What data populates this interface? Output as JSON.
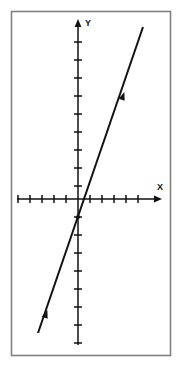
{
  "figure": {
    "title": "",
    "frame": {
      "color": "#808080",
      "x": 11,
      "y": 11,
      "width": 159,
      "height": 344
    },
    "background_color": "#ffffff",
    "ink_color": "#111111"
  },
  "axes": {
    "x_axis": {
      "label": "X",
      "label_x": 160,
      "label_y": 190,
      "y_pixel": 199,
      "start_x": 17,
      "end_x": 162,
      "tick_spacing_px": 12,
      "tick_half_length": 4,
      "ticks_left_px": [
        18,
        30,
        42,
        54,
        66
      ],
      "ticks_right_px": [
        90,
        102,
        114,
        126,
        138
      ],
      "arrow_at": "right"
    },
    "y_axis": {
      "label": "Y",
      "label_x": 84,
      "label_y": 25,
      "x_pixel": 78,
      "start_y": 19,
      "end_y": 345,
      "tick_spacing_px": 18,
      "tick_half_length": 4,
      "ticks_above_px": [
        42,
        60,
        78,
        96,
        114,
        132,
        150,
        168,
        186
      ],
      "ticks_below_px": [
        217,
        235,
        253,
        271,
        289,
        307,
        325,
        343
      ],
      "arrow_at": "top"
    },
    "origin": {
      "x": 78,
      "y": 199
    }
  },
  "chart_data": {
    "type": "line",
    "title": "",
    "xlabel": "X",
    "ylabel": "Y",
    "grid": false,
    "legend": null,
    "axis_style": "cartesian-arrows-with-unlabeled-ticks",
    "x_unit_px": 12,
    "y_unit_px": 18,
    "xlim": [
      -5.1,
      7.0
    ],
    "ylim": [
      -8.1,
      10.0
    ],
    "series": [
      {
        "name": "line",
        "style": "solid",
        "color": "#111111",
        "width_px": 2,
        "endpoints_px": [
          {
            "x": 38,
            "y": 333
          },
          {
            "x": 143,
            "y": 27
          }
        ],
        "endpoints_units": [
          {
            "x": -3.33,
            "y": -7.44
          },
          {
            "x": 5.42,
            "y": 9.56
          }
        ],
        "slope_units": 1.94,
        "x_intercept_units": 0.5,
        "y_intercept_units": -1.0,
        "direction_markers_px": [
          {
            "x": 123,
            "y": 96,
            "kind": "arrowhead-up-right"
          },
          {
            "x": 46,
            "y": 314,
            "kind": "arrowhead-up-right"
          }
        ],
        "marked_point_px": {
          "x": 78,
          "y": 217
        },
        "marked_point_units": {
          "x": 0,
          "y": -1
        }
      }
    ]
  }
}
